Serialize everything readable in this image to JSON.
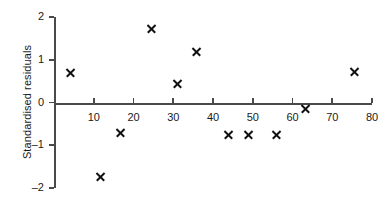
{
  "chart_data": {
    "type": "scatter",
    "title": "",
    "xlabel": "",
    "ylabel": "Standardised residuals",
    "xlim": [
      0,
      80
    ],
    "ylim": [
      -2,
      2
    ],
    "grid": false,
    "legend": false,
    "xticks": [
      10,
      20,
      30,
      40,
      50,
      60,
      70,
      80
    ],
    "xtick_labels": [
      "10",
      "20",
      "30",
      "40",
      "50",
      "60",
      "70",
      "80"
    ],
    "yticks": [
      2,
      1,
      0,
      -1,
      -2
    ],
    "ytick_labels": [
      "2",
      "1",
      "0",
      "–1",
      "–2"
    ],
    "marker": "x",
    "marker_color": "#111111",
    "axis_color": "#4a4a4a",
    "points": [
      {
        "x": 4.2,
        "y": 0.7
      },
      {
        "x": 11.8,
        "y": -1.73
      },
      {
        "x": 16.8,
        "y": -0.7
      },
      {
        "x": 24.5,
        "y": 1.73
      },
      {
        "x": 31.0,
        "y": 0.45
      },
      {
        "x": 35.8,
        "y": 1.2
      },
      {
        "x": 44.0,
        "y": -0.75
      },
      {
        "x": 49.0,
        "y": -0.74
      },
      {
        "x": 56.0,
        "y": -0.74
      },
      {
        "x": 63.3,
        "y": -0.13
      },
      {
        "x": 75.5,
        "y": 0.73
      }
    ]
  }
}
